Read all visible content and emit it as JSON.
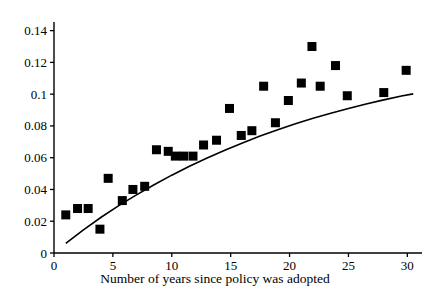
{
  "chart_data": {
    "type": "scatter",
    "title": "",
    "subtitle": "",
    "xlabel": "Number of years since policy was adopted",
    "ylabel": "",
    "xlim": [
      0,
      31.5
    ],
    "ylim": [
      0,
      0.147
    ],
    "grid": false,
    "legend": null,
    "marker": {
      "shape": "square",
      "color": "#000000",
      "size_px": 9
    },
    "xticks": [
      0,
      5,
      10,
      15,
      20,
      25,
      30
    ],
    "xtick_labels": [
      "0",
      "5",
      "10",
      "15",
      "20",
      "25",
      "30"
    ],
    "yticks": [
      0,
      0.02,
      0.04,
      0.06,
      0.08,
      0.1,
      0.12,
      0.14
    ],
    "ytick_labels": [
      "0",
      "0.02",
      "0.04",
      "0.06",
      "0.08",
      "0.1",
      "0.12",
      "0.14"
    ],
    "points": [
      {
        "x": 1.0,
        "y": 0.024
      },
      {
        "x": 2.0,
        "y": 0.028
      },
      {
        "x": 2.9,
        "y": 0.028
      },
      {
        "x": 3.9,
        "y": 0.015
      },
      {
        "x": 4.6,
        "y": 0.047
      },
      {
        "x": 5.8,
        "y": 0.033
      },
      {
        "x": 6.7,
        "y": 0.04
      },
      {
        "x": 7.7,
        "y": 0.042
      },
      {
        "x": 8.7,
        "y": 0.065
      },
      {
        "x": 9.7,
        "y": 0.064
      },
      {
        "x": 10.3,
        "y": 0.061
      },
      {
        "x": 11.0,
        "y": 0.061
      },
      {
        "x": 11.8,
        "y": 0.061
      },
      {
        "x": 12.7,
        "y": 0.068
      },
      {
        "x": 13.8,
        "y": 0.071
      },
      {
        "x": 14.9,
        "y": 0.091
      },
      {
        "x": 15.9,
        "y": 0.074
      },
      {
        "x": 16.8,
        "y": 0.077
      },
      {
        "x": 17.8,
        "y": 0.105
      },
      {
        "x": 18.8,
        "y": 0.082
      },
      {
        "x": 19.9,
        "y": 0.096
      },
      {
        "x": 21.0,
        "y": 0.107
      },
      {
        "x": 21.9,
        "y": 0.13
      },
      {
        "x": 22.6,
        "y": 0.105
      },
      {
        "x": 23.9,
        "y": 0.118
      },
      {
        "x": 24.9,
        "y": 0.099
      },
      {
        "x": 28.0,
        "y": 0.101
      },
      {
        "x": 29.9,
        "y": 0.115
      }
    ],
    "fit_curve": {
      "name": "fitted-trend-curve",
      "description": "concave increasing fitted curve",
      "color": "#000000",
      "width_px": 1.6,
      "x": [
        1.0,
        2.5,
        4.0,
        5.5,
        7.0,
        8.5,
        10.0,
        11.5,
        13.0,
        14.5,
        16.0,
        17.5,
        19.0,
        20.5,
        22.0,
        23.5,
        25.0,
        26.5,
        28.0,
        29.5,
        30.5
      ],
      "y": [
        0.006,
        0.0145,
        0.0225,
        0.0298,
        0.0366,
        0.043,
        0.049,
        0.0546,
        0.0598,
        0.0647,
        0.0693,
        0.0736,
        0.0776,
        0.0813,
        0.0848,
        0.088,
        0.091,
        0.0938,
        0.0964,
        0.0988,
        0.1002
      ]
    }
  },
  "axis_labels": {
    "x_title": "Number of years since policy was adopted"
  }
}
